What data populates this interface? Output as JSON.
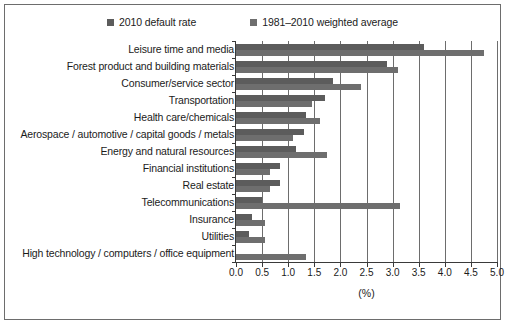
{
  "chart_data": {
    "type": "bar",
    "orientation": "horizontal",
    "title": "",
    "xlabel": "(%)",
    "ylabel": "",
    "xlim": [
      0.0,
      5.0
    ],
    "xticks": [
      "0.0",
      "0.5",
      "1.0",
      "1.5",
      "2.0",
      "2.5",
      "3.0",
      "3.5",
      "4.0",
      "4.5",
      "5.0"
    ],
    "grid": "vertical",
    "legend_position": "top-center",
    "categories": [
      "Leisure time and media",
      "Forest product and building materials",
      "Consumer/service sector",
      "Transportation",
      "Health care/chemicals",
      "Aerospace / automotive / capital goods / metals",
      "Energy and natural resources",
      "Financial institutions",
      "Real estate",
      "Telecommunications",
      "Insurance",
      "Utilities",
      "High technology / computers / office equipment"
    ],
    "series": [
      {
        "name": "2010 default rate",
        "color": "#5c5c5c",
        "values": [
          3.6,
          2.9,
          1.85,
          1.7,
          1.35,
          1.3,
          1.15,
          0.85,
          0.85,
          0.5,
          0.3,
          0.25,
          0.0
        ]
      },
      {
        "name": "1981–2010 weighted average",
        "color": "#6e6e6e",
        "values": [
          4.75,
          3.1,
          2.4,
          1.45,
          1.6,
          1.1,
          1.75,
          0.65,
          0.65,
          3.15,
          0.55,
          0.55,
          1.35
        ]
      }
    ]
  },
  "legend": {
    "entries": [
      {
        "label": "2010 default rate"
      },
      {
        "label": "1981–2010 weighted average"
      }
    ]
  },
  "colors": {
    "bar_default": "#5c5c5c",
    "bar_weighted": "#6e6e6e",
    "axis": "#3a3a3a",
    "grid": "#6d6d6d",
    "frame": "#6d6d6d",
    "background": "#ffffff",
    "text": "#1b1b1b"
  }
}
